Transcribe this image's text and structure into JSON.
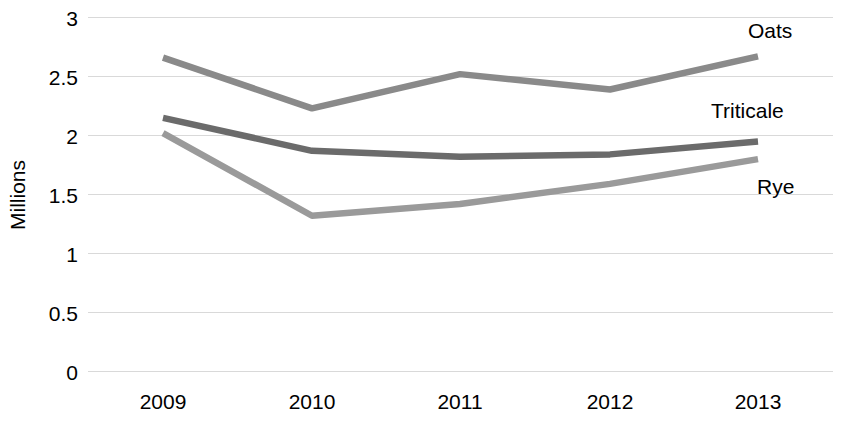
{
  "chart_data": {
    "type": "line",
    "title": "",
    "xlabel": "",
    "ylabel": "Millions",
    "categories": [
      "2009",
      "2010",
      "2011",
      "2012",
      "2013"
    ],
    "ylim": [
      0,
      3
    ],
    "yticks": [
      "0",
      "0.5",
      "1",
      "1.5",
      "2",
      "2.5",
      "3"
    ],
    "ytick_values": [
      0,
      0.5,
      1,
      1.5,
      2,
      2.5,
      3
    ],
    "grid": true,
    "legend_position": "inline-right-labels",
    "series": [
      {
        "name": "Oats",
        "values": [
          2.66,
          2.23,
          2.52,
          2.39,
          2.67
        ],
        "color": "#8a8a8a"
      },
      {
        "name": "Triticale",
        "values": [
          2.15,
          1.87,
          1.82,
          1.84,
          1.95
        ],
        "color": "#6b6b6b"
      },
      {
        "name": "Rye",
        "values": [
          2.02,
          1.32,
          1.42,
          1.59,
          1.8
        ],
        "color": "#9a9a9a"
      }
    ]
  },
  "axis": {
    "y_title": "Millions"
  },
  "labels": {
    "oats": "Oats",
    "triticale": "Triticale",
    "rye": "Rye"
  },
  "colors": {
    "gridline": "#d9d9d9",
    "text": "#000000",
    "background": "#ffffff"
  }
}
